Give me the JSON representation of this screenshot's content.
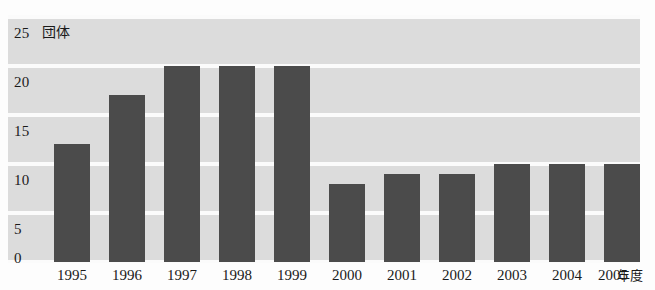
{
  "chart_data": {
    "type": "bar",
    "title": "",
    "subtitle": "",
    "xlabel": "年度",
    "ylabel": "団体",
    "unit_label": "団体",
    "x_axis_suffix": "年度",
    "categories": [
      "1995",
      "1996",
      "1997",
      "1998",
      "1999",
      "2000",
      "2001",
      "2002",
      "2003",
      "2004",
      "2005"
    ],
    "values": [
      12,
      17,
      20,
      20,
      20,
      8,
      9,
      9,
      10,
      10,
      10
    ],
    "series": [
      {
        "name": "団体数",
        "values": [
          12,
          17,
          20,
          20,
          20,
          8,
          9,
          9,
          10,
          10,
          10
        ]
      }
    ],
    "ylim": [
      0,
      25
    ],
    "y_ticks": [
      0,
      5,
      10,
      15,
      20,
      25
    ],
    "y_tick_labels": [
      "0",
      "5",
      "10",
      "15",
      "20",
      "25"
    ],
    "grid": true,
    "grid_orientation": "horizontal",
    "legend": false,
    "legend_position": "none",
    "annotations": [],
    "colors": {
      "bar": "#4b4b4b",
      "plot_background": "#dcdcdc",
      "gridline": "#fbfbfb",
      "text": "#1a1a1a",
      "page_background": "#fdfdfd"
    }
  }
}
